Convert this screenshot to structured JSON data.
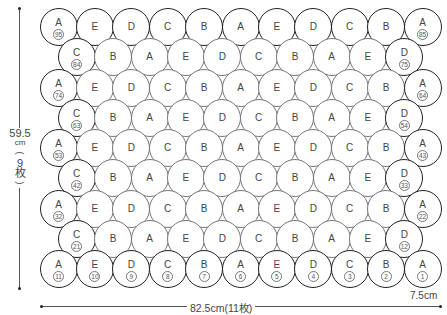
{
  "diagram": {
    "rows": [
      {
        "y": 27,
        "offset": 0,
        "letters": [
          "A",
          "E",
          "D",
          "C",
          "B",
          "A",
          "E",
          "D",
          "C",
          "B",
          "A"
        ],
        "numbers": {
          "0": "95",
          "10": "85"
        }
      },
      {
        "y": 57,
        "offset": 1,
        "letters": [
          "C",
          "B",
          "A",
          "E",
          "D",
          "C",
          "B",
          "A",
          "E",
          "D"
        ],
        "numbers": {
          "0": "84",
          "9": "75"
        }
      },
      {
        "y": 88,
        "offset": 0,
        "letters": [
          "A",
          "E",
          "D",
          "C",
          "B",
          "A",
          "E",
          "D",
          "C",
          "B",
          "A"
        ],
        "numbers": {
          "0": "74",
          "10": "64"
        }
      },
      {
        "y": 118,
        "offset": 1,
        "letters": [
          "C",
          "B",
          "A",
          "E",
          "D",
          "C",
          "B",
          "A",
          "E",
          "D"
        ],
        "numbers": {
          "0": "63",
          "9": "54"
        }
      },
      {
        "y": 148,
        "offset": 0,
        "letters": [
          "A",
          "E",
          "D",
          "C",
          "B",
          "A",
          "E",
          "D",
          "C",
          "B",
          "A"
        ],
        "numbers": {
          "0": "53",
          "10": "43"
        }
      },
      {
        "y": 178,
        "offset": 1,
        "letters": [
          "C",
          "B",
          "A",
          "E",
          "D",
          "C",
          "B",
          "A",
          "E",
          "D"
        ],
        "numbers": {
          "0": "42",
          "9": "33"
        }
      },
      {
        "y": 209,
        "offset": 0,
        "letters": [
          "A",
          "E",
          "D",
          "C",
          "B",
          "A",
          "E",
          "D",
          "C",
          "B",
          "A"
        ],
        "numbers": {
          "0": "32",
          "10": "22"
        }
      },
      {
        "y": 239,
        "offset": 1,
        "letters": [
          "C",
          "B",
          "A",
          "E",
          "D",
          "C",
          "B",
          "A",
          "E",
          "D"
        ],
        "numbers": {
          "0": "21",
          "9": "12"
        }
      },
      {
        "y": 269,
        "offset": 0,
        "letters": [
          "A",
          "E",
          "D",
          "C",
          "B",
          "A",
          "E",
          "D",
          "C",
          "B",
          "A"
        ],
        "numbers": {
          "0": "11",
          "1": "10",
          "2": "9",
          "3": "8",
          "4": "7",
          "5": "6",
          "6": "5",
          "7": "4",
          "8": "3",
          "9": "2",
          "10": "1"
        }
      }
    ],
    "dimensions": {
      "height_value": "59.5",
      "height_unit": "cm",
      "height_open": "(",
      "height_count": "9",
      "height_count_unit": "枚",
      "height_close": ")",
      "width_label": "82.5cm(11枚)",
      "circle_label": "7.5cm"
    },
    "colors": {
      "edge": "#222222",
      "inner": "#777777",
      "text": "#444444"
    }
  }
}
